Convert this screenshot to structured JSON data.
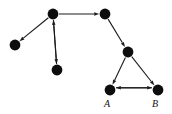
{
  "figure": {
    "title": "",
    "background_color": "#ffffff",
    "node_color": "#0d0d0d",
    "edge_color": "#1a1a1a",
    "width": 172,
    "height": 114
  },
  "graph": {
    "type": "directed-graph",
    "node_radius": 5.4,
    "nodes": [
      {
        "id": "n1",
        "label": "",
        "x": 53,
        "y": 14
      },
      {
        "id": "n2",
        "label": "",
        "x": 15,
        "y": 45
      },
      {
        "id": "n3",
        "label": "",
        "x": 57,
        "y": 70
      },
      {
        "id": "n4",
        "label": "",
        "x": 105,
        "y": 14
      },
      {
        "id": "n5",
        "label": "",
        "x": 128,
        "y": 52
      },
      {
        "id": "a",
        "label": "A",
        "x": 110,
        "y": 90
      },
      {
        "id": "b",
        "label": "B",
        "x": 158,
        "y": 90
      }
    ],
    "labels": [
      {
        "id": "label-a",
        "text": "A",
        "x": 107,
        "y": 107
      },
      {
        "id": "label-b",
        "text": "B",
        "x": 155,
        "y": 107
      }
    ],
    "edges": [
      {
        "id": "e1",
        "from": "n3",
        "to": "n1",
        "directed": true
      },
      {
        "id": "e2",
        "from": "n1",
        "to": "n2",
        "directed": true
      },
      {
        "id": "e3",
        "from": "n1",
        "to": "n3",
        "directed": true
      },
      {
        "id": "e4",
        "from": "n1",
        "to": "n4",
        "directed": true
      },
      {
        "id": "e5",
        "from": "n4",
        "to": "n5",
        "directed": true
      },
      {
        "id": "e6",
        "from": "n5",
        "to": "a",
        "directed": true
      },
      {
        "id": "e7",
        "from": "n5",
        "to": "b",
        "directed": true
      },
      {
        "id": "e8",
        "from": "a",
        "to": "b",
        "directed": true,
        "offset": -2.2
      },
      {
        "id": "e9",
        "from": "b",
        "to": "a",
        "directed": true,
        "offset": 2.2
      }
    ]
  }
}
